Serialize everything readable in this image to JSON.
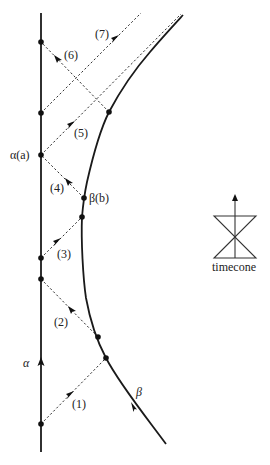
{
  "diagram": {
    "worldlines": [
      {
        "id": "alpha",
        "label": "α",
        "style": "solid-vertical"
      },
      {
        "id": "beta",
        "label": "β",
        "style": "solid-curve"
      }
    ],
    "events": {
      "alpha_a": "α(a)",
      "beta_b": "β(b)"
    },
    "signals": [
      {
        "id": "1",
        "label": "(1)",
        "direction": "alpha-to-beta"
      },
      {
        "id": "2",
        "label": "(2)",
        "direction": "beta-to-alpha"
      },
      {
        "id": "3",
        "label": "(3)",
        "direction": "alpha-to-beta"
      },
      {
        "id": "4",
        "label": "(4)",
        "direction": "beta-to-alpha"
      },
      {
        "id": "5",
        "label": "(5)",
        "direction": "alpha-outward"
      },
      {
        "id": "6",
        "label": "(6)",
        "direction": "beta-to-alpha"
      },
      {
        "id": "7",
        "label": "(7)",
        "direction": "alpha-outward"
      }
    ],
    "legend": {
      "label": "timecone",
      "icon": "timecone-icon"
    }
  }
}
